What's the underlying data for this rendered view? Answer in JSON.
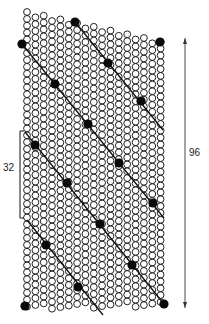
{
  "diagram": {
    "type": "staggered-lattice-with-helical-lines",
    "colors": {
      "open_circle": "#222222",
      "filled_circle": "#0a0a0a",
      "line": "#111111",
      "background": "#ffffff"
    },
    "lattice": {
      "columns": 17,
      "col_x0": 27,
      "col_dx": 8.35,
      "row_dy": 6.85,
      "col_shift_y": 1.1,
      "radius": 3.4,
      "top_edge": {
        "x1": 27,
        "y1": 12,
        "x2": 162,
        "y2": 42
      },
      "bottom_edge": {
        "x1": 27,
        "y1": 309,
        "x2": 162,
        "y2": 307
      }
    },
    "filled_dots": [
      [
        22,
        44
      ],
      [
        75,
        22
      ],
      [
        160,
        42
      ],
      [
        108,
        63
      ],
      [
        55,
        84
      ],
      [
        141,
        101
      ],
      [
        88,
        124
      ],
      [
        35,
        145
      ],
      [
        119,
        163
      ],
      [
        67,
        183
      ],
      [
        153,
        203
      ],
      [
        100,
        224
      ],
      [
        46,
        245
      ],
      [
        132,
        265
      ],
      [
        78,
        287
      ],
      [
        25,
        306
      ],
      [
        164,
        304
      ]
    ],
    "lines": [
      {
        "x1": 22,
        "y1": 44,
        "x2": 164,
        "y2": 218
      },
      {
        "x1": 75,
        "y1": 22,
        "x2": 163,
        "y2": 130
      },
      {
        "x1": 25,
        "y1": 132,
        "x2": 164,
        "y2": 304
      },
      {
        "x1": 27,
        "y1": 220,
        "x2": 103,
        "y2": 315
      }
    ],
    "bracket": {
      "x": 20,
      "y1": 131,
      "y2": 218,
      "tick": 4,
      "label": "32",
      "label_x": 3,
      "label_y": 168
    },
    "arrow": {
      "x": 185,
      "y1": 38,
      "y2": 308,
      "label": "96",
      "label_x": 189,
      "label_y": 152
    }
  }
}
